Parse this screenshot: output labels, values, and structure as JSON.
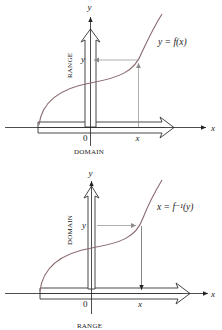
{
  "colors": {
    "axis": "#222222",
    "curve": "#8a6a6e",
    "guide": "#8c8c8c",
    "fat_arrow": "#333333",
    "background": "#ffffff"
  },
  "diagrams": [
    {
      "id": "function",
      "x_axis_label": "x",
      "y_axis_label": "y",
      "origin_label": "0",
      "curve_label": "y = f(x)",
      "point_x_label": "x",
      "point_y_label": "y",
      "horizontal_band_label": "DOMAIN",
      "vertical_band_label": "RANGE",
      "mapping_direction": "x → y (up, then left)"
    },
    {
      "id": "inverse",
      "x_axis_label": "x",
      "y_axis_label": "y",
      "origin_label": "0",
      "curve_label": "x = f⁻¹(y)",
      "point_x_label": "x",
      "point_y_label": "y",
      "horizontal_band_label": "RANGE",
      "vertical_band_label": "DOMAIN",
      "mapping_direction": "y → x (right, then down)"
    }
  ]
}
